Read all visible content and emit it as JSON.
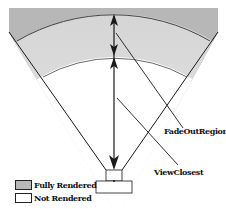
{
  "diagram": {
    "labels": {
      "fade_out_region": "FadeOutRegion",
      "view_closest": "ViewClosest"
    },
    "legend": [
      {
        "label": "Fully Rendered",
        "color": "#b8b8b8"
      },
      {
        "label": "Not Rendered",
        "color": "#ffffff"
      }
    ],
    "colors": {
      "outer_region": "#b5b5b5",
      "fade_region_top": "#d9d9d9",
      "fade_region_bottom": "#f8f8f8",
      "lines": "#1a1a1a"
    }
  }
}
